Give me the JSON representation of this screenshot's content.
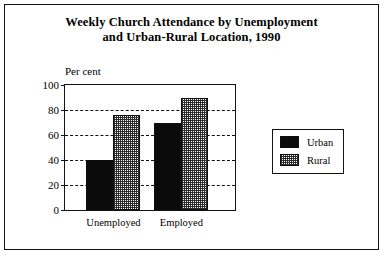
{
  "figure": {
    "title_line1": "Weekly Church Attendance by Unemployment",
    "title_line2": "and Urban-Rural Location, 1990"
  },
  "legend": {
    "items": [
      {
        "label": "Urban",
        "swatch": "solid-black-swatch"
      },
      {
        "label": "Rural",
        "swatch": "stippled-gray-swatch"
      }
    ]
  },
  "chart_data": {
    "type": "bar",
    "title": "Weekly Church Attendance by Unemployment and Urban-Rural Location, 1990",
    "categories": [
      "Unemployed",
      "Employed"
    ],
    "series": [
      {
        "name": "Urban",
        "values": [
          40,
          70
        ]
      },
      {
        "name": "Rural",
        "values": [
          76,
          90
        ]
      }
    ],
    "xlabel": "",
    "ylabel": "Per cent",
    "ylim": [
      0,
      100
    ],
    "yticks": [
      0,
      20,
      40,
      60,
      80,
      100
    ],
    "ytick_labels": [
      "0",
      "20",
      "40",
      "60",
      "80",
      "100"
    ],
    "grid": true,
    "grid_style": "dashed-horizontal",
    "legend_position": "right-outside"
  }
}
